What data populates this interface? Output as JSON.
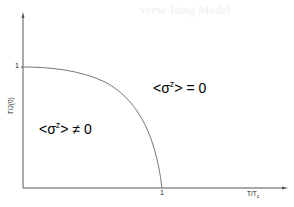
{
  "background_ghost_text": "verse Ising Model",
  "diagram": {
    "type": "phase-diagram",
    "x_axis": {
      "label": "T/T",
      "label_subscript": "c",
      "tick": "1"
    },
    "y_axis": {
      "label": "Γ/J(0)",
      "tick": "1"
    },
    "regions": [
      {
        "name": "ordered",
        "prefix": "<σ",
        "superscript": "z",
        "suffix": "> ≠ 0"
      },
      {
        "name": "disordered",
        "prefix": "<σ",
        "superscript": "z",
        "suffix": "> = 0"
      }
    ],
    "boundary_curve": "quarter-ellipse-like from (0,1) to (1,0)",
    "colors": {
      "axis": "#555555",
      "curve": "#777777",
      "text": "#000000"
    }
  }
}
